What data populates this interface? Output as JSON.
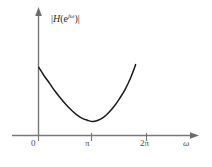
{
  "figure": {
    "kind": "magnitude-response-plot",
    "background_color": "#ffffff",
    "axis_color": "#777777",
    "curve_color": "#1a1a1a",
    "label_color": "#4a4a4a"
  },
  "labels": {
    "y_axis_magnitude_bar_open": "|",
    "y_axis_magnitude_h": "H",
    "y_axis_magnitude_paren_open": "(",
    "y_axis_magnitude_e": "e",
    "y_axis_magnitude_exponent": "jω",
    "y_axis_magnitude_paren_close": ")",
    "y_axis_magnitude_bar_close": "|",
    "y_axis_magnitude_plain": "|H(e^{jω})|",
    "x_axis_name": "ω"
  },
  "ticks": {
    "x": [
      {
        "label": "0",
        "value": 0
      },
      {
        "label": "π",
        "value": 3.14159
      },
      {
        "label": "2π",
        "value": 6.28318
      }
    ]
  },
  "chart_data": {
    "type": "line",
    "title": "",
    "subtitle": "",
    "xlabel": "ω",
    "ylabel": "|H(e^{jω})|",
    "xlim": [
      0,
      7.5
    ],
    "ylim": [
      0,
      1.25
    ],
    "grid": false,
    "legend": "none",
    "xticks": [
      0,
      3.14159,
      6.28318
    ],
    "xticklabels": [
      "0",
      "π",
      "2π"
    ],
    "yticks": [],
    "yticklabels": [],
    "annotations": [],
    "series": [
      {
        "name": "|H(e^{jω})|",
        "color": "#1a1a1a",
        "x": [
          0.0,
          0.31,
          0.63,
          0.94,
          1.26,
          1.57,
          1.88,
          2.2,
          2.51,
          2.83,
          3.14,
          3.46,
          3.77,
          4.08,
          4.4,
          4.71,
          5.03,
          5.34,
          5.65
        ],
        "y": [
          0.98,
          0.86,
          0.75,
          0.64,
          0.54,
          0.45,
          0.37,
          0.3,
          0.25,
          0.22,
          0.2,
          0.22,
          0.26,
          0.33,
          0.42,
          0.53,
          0.66,
          0.82,
          1.02
        ]
      }
    ]
  }
}
